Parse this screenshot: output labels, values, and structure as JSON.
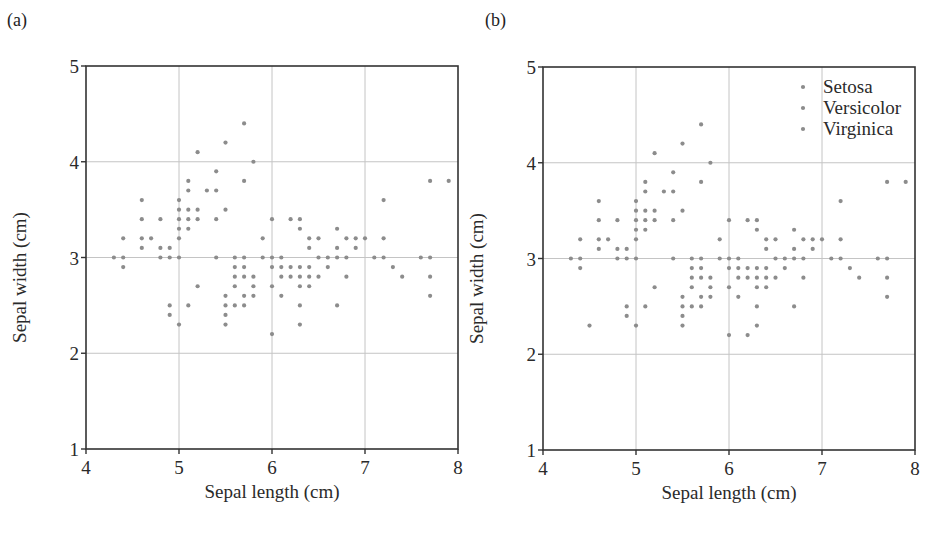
{
  "figure": {
    "panels": [
      {
        "label": "(a)",
        "xlabel": "Sepal length (cm)",
        "ylabel": "Sepal width (cm)"
      },
      {
        "label": "(b)",
        "xlabel": "Sepal length (cm)",
        "ylabel": "Sepal width (cm)"
      }
    ],
    "colors": {
      "dot": "#8c8c8c",
      "grid": "#c4c4c4",
      "axis": "#333333",
      "text": "#2a2a2a"
    }
  },
  "chart_data": [
    {
      "type": "scatter",
      "title": "(a)",
      "xlabel": "Sepal length (cm)",
      "ylabel": "Sepal width (cm)",
      "xlim": [
        4,
        8
      ],
      "ylim": [
        1,
        5
      ],
      "xticks": [
        4,
        5,
        6,
        7,
        8
      ],
      "yticks": [
        1,
        2,
        3,
        4,
        5
      ],
      "grid": true,
      "legend": null,
      "series": [
        {
          "name": "Iris (all)",
          "points": [
            [
              4.3,
              3.0
            ],
            [
              4.4,
              3.0
            ],
            [
              4.4,
              3.2
            ],
            [
              4.4,
              2.9
            ],
            [
              4.6,
              3.1
            ],
            [
              4.6,
              3.4
            ],
            [
              4.6,
              3.6
            ],
            [
              4.6,
              3.2
            ],
            [
              4.7,
              3.2
            ],
            [
              4.8,
              3.4
            ],
            [
              4.8,
              3.0
            ],
            [
              4.8,
              3.1
            ],
            [
              4.9,
              3.0
            ],
            [
              4.9,
              3.1
            ],
            [
              4.9,
              2.5
            ],
            [
              4.9,
              2.4
            ],
            [
              5.0,
              3.6
            ],
            [
              5.0,
              3.4
            ],
            [
              5.0,
              3.0
            ],
            [
              5.0,
              3.3
            ],
            [
              5.0,
              3.5
            ],
            [
              5.0,
              3.2
            ],
            [
              5.0,
              2.3
            ],
            [
              5.1,
              3.5
            ],
            [
              5.1,
              3.7
            ],
            [
              5.1,
              3.3
            ],
            [
              5.1,
              3.4
            ],
            [
              5.1,
              3.8
            ],
            [
              5.1,
              2.5
            ],
            [
              5.2,
              3.5
            ],
            [
              5.2,
              3.4
            ],
            [
              5.2,
              4.1
            ],
            [
              5.2,
              2.7
            ],
            [
              5.3,
              3.7
            ],
            [
              5.4,
              3.9
            ],
            [
              5.4,
              3.7
            ],
            [
              5.4,
              3.4
            ],
            [
              5.4,
              3.0
            ],
            [
              5.5,
              4.2
            ],
            [
              5.5,
              3.5
            ],
            [
              5.5,
              2.3
            ],
            [
              5.5,
              2.4
            ],
            [
              5.5,
              2.5
            ],
            [
              5.5,
              2.6
            ],
            [
              5.6,
              2.9
            ],
            [
              5.6,
              3.0
            ],
            [
              5.6,
              2.5
            ],
            [
              5.6,
              2.7
            ],
            [
              5.6,
              2.8
            ],
            [
              5.7,
              4.4
            ],
            [
              5.7,
              3.8
            ],
            [
              5.7,
              2.8
            ],
            [
              5.7,
              2.6
            ],
            [
              5.7,
              3.0
            ],
            [
              5.7,
              2.9
            ],
            [
              5.7,
              2.5
            ],
            [
              5.8,
              4.0
            ],
            [
              5.8,
              2.7
            ],
            [
              5.8,
              2.6
            ],
            [
              5.8,
              2.8
            ],
            [
              5.9,
              3.0
            ],
            [
              5.9,
              3.2
            ],
            [
              6.0,
              2.2
            ],
            [
              6.0,
              2.9
            ],
            [
              6.0,
              2.7
            ],
            [
              6.0,
              3.4
            ],
            [
              6.0,
              3.0
            ],
            [
              6.1,
              2.9
            ],
            [
              6.1,
              2.8
            ],
            [
              6.1,
              3.0
            ],
            [
              6.1,
              2.6
            ],
            [
              6.2,
              2.9
            ],
            [
              6.2,
              2.8
            ],
            [
              6.2,
              3.4
            ],
            [
              6.3,
              3.3
            ],
            [
              6.3,
              2.5
            ],
            [
              6.3,
              2.3
            ],
            [
              6.3,
              2.9
            ],
            [
              6.3,
              2.7
            ],
            [
              6.3,
              2.8
            ],
            [
              6.3,
              3.4
            ],
            [
              6.4,
              3.2
            ],
            [
              6.4,
              2.9
            ],
            [
              6.4,
              2.7
            ],
            [
              6.4,
              2.8
            ],
            [
              6.4,
              3.1
            ],
            [
              6.5,
              2.8
            ],
            [
              6.5,
              3.0
            ],
            [
              6.5,
              3.2
            ],
            [
              6.6,
              2.9
            ],
            [
              6.6,
              3.0
            ],
            [
              6.7,
              3.1
            ],
            [
              6.7,
              3.0
            ],
            [
              6.7,
              2.5
            ],
            [
              6.7,
              3.3
            ],
            [
              6.8,
              2.8
            ],
            [
              6.8,
              3.0
            ],
            [
              6.8,
              3.2
            ],
            [
              6.9,
              3.1
            ],
            [
              6.9,
              3.2
            ],
            [
              7.0,
              3.2
            ],
            [
              7.1,
              3.0
            ],
            [
              7.2,
              3.6
            ],
            [
              7.2,
              3.2
            ],
            [
              7.2,
              3.0
            ],
            [
              7.3,
              2.9
            ],
            [
              7.4,
              2.8
            ],
            [
              7.6,
              3.0
            ],
            [
              7.7,
              3.8
            ],
            [
              7.7,
              2.6
            ],
            [
              7.7,
              2.8
            ],
            [
              7.7,
              3.0
            ],
            [
              7.9,
              3.8
            ]
          ]
        }
      ]
    },
    {
      "type": "scatter",
      "title": "(b)",
      "xlabel": "Sepal length (cm)",
      "ylabel": "Sepal width (cm)",
      "xlim": [
        4,
        8
      ],
      "ylim": [
        1,
        5
      ],
      "xticks": [
        4,
        5,
        6,
        7,
        8
      ],
      "yticks": [
        1,
        2,
        3,
        4,
        5
      ],
      "grid": true,
      "legend": {
        "position": "upper right",
        "entries": [
          "Setosa",
          "Versicolor",
          "Virginica"
        ]
      },
      "series": [
        {
          "name": "Setosa",
          "points": [
            [
              4.3,
              3.0
            ],
            [
              4.4,
              3.0
            ],
            [
              4.4,
              3.2
            ],
            [
              4.4,
              2.9
            ],
            [
              4.5,
              2.3
            ],
            [
              4.6,
              3.1
            ],
            [
              4.6,
              3.4
            ],
            [
              4.6,
              3.6
            ],
            [
              4.6,
              3.2
            ],
            [
              4.7,
              3.2
            ],
            [
              4.8,
              3.4
            ],
            [
              4.8,
              3.0
            ],
            [
              4.8,
              3.1
            ],
            [
              4.9,
              3.0
            ],
            [
              4.9,
              3.1
            ],
            [
              5.0,
              3.6
            ],
            [
              5.0,
              3.4
            ],
            [
              5.0,
              3.0
            ],
            [
              5.0,
              3.3
            ],
            [
              5.0,
              3.5
            ],
            [
              5.0,
              3.2
            ],
            [
              5.1,
              3.5
            ],
            [
              5.1,
              3.7
            ],
            [
              5.1,
              3.3
            ],
            [
              5.1,
              3.4
            ],
            [
              5.1,
              3.8
            ],
            [
              5.2,
              3.5
            ],
            [
              5.2,
              3.4
            ],
            [
              5.2,
              4.1
            ],
            [
              5.3,
              3.7
            ],
            [
              5.4,
              3.9
            ],
            [
              5.4,
              3.7
            ],
            [
              5.4,
              3.4
            ],
            [
              5.5,
              4.2
            ],
            [
              5.5,
              3.5
            ],
            [
              5.7,
              4.4
            ],
            [
              5.7,
              3.8
            ],
            [
              5.8,
              4.0
            ]
          ]
        },
        {
          "name": "Versicolor",
          "points": [
            [
              4.9,
              2.4
            ],
            [
              5.0,
              2.3
            ],
            [
              5.1,
              2.5
            ],
            [
              5.2,
              2.7
            ],
            [
              5.4,
              3.0
            ],
            [
              5.5,
              2.3
            ],
            [
              5.5,
              2.4
            ],
            [
              5.5,
              2.5
            ],
            [
              5.5,
              2.6
            ],
            [
              5.6,
              2.9
            ],
            [
              5.6,
              3.0
            ],
            [
              5.6,
              2.5
            ],
            [
              5.6,
              2.7
            ],
            [
              5.7,
              2.8
            ],
            [
              5.7,
              2.6
            ],
            [
              5.7,
              3.0
            ],
            [
              5.7,
              2.9
            ],
            [
              5.8,
              2.7
            ],
            [
              5.8,
              2.6
            ],
            [
              5.9,
              3.0
            ],
            [
              5.9,
              3.2
            ],
            [
              6.0,
              2.2
            ],
            [
              6.0,
              2.9
            ],
            [
              6.0,
              2.7
            ],
            [
              6.0,
              3.4
            ],
            [
              6.1,
              2.9
            ],
            [
              6.1,
              2.8
            ],
            [
              6.1,
              3.0
            ],
            [
              6.2,
              2.2
            ],
            [
              6.2,
              2.9
            ],
            [
              6.3,
              3.3
            ],
            [
              6.3,
              2.5
            ],
            [
              6.3,
              2.3
            ],
            [
              6.4,
              3.2
            ],
            [
              6.4,
              2.9
            ],
            [
              6.5,
              2.8
            ],
            [
              6.6,
              2.9
            ],
            [
              6.6,
              3.0
            ],
            [
              6.7,
              3.1
            ],
            [
              6.7,
              3.0
            ],
            [
              6.8,
              2.8
            ],
            [
              6.9,
              3.1
            ],
            [
              7.0,
              3.2
            ]
          ]
        },
        {
          "name": "Virginica",
          "points": [
            [
              4.9,
              2.5
            ],
            [
              5.6,
              2.8
            ],
            [
              5.7,
              2.5
            ],
            [
              5.8,
              2.8
            ],
            [
              6.0,
              3.0
            ],
            [
              6.1,
              2.6
            ],
            [
              6.2,
              2.8
            ],
            [
              6.2,
              3.4
            ],
            [
              6.3,
              2.9
            ],
            [
              6.3,
              2.7
            ],
            [
              6.3,
              2.8
            ],
            [
              6.3,
              3.4
            ],
            [
              6.4,
              2.7
            ],
            [
              6.4,
              2.8
            ],
            [
              6.4,
              3.1
            ],
            [
              6.5,
              3.0
            ],
            [
              6.5,
              3.2
            ],
            [
              6.7,
              2.5
            ],
            [
              6.7,
              3.3
            ],
            [
              6.8,
              3.0
            ],
            [
              6.8,
              3.2
            ],
            [
              6.9,
              3.2
            ],
            [
              7.1,
              3.0
            ],
            [
              7.2,
              3.6
            ],
            [
              7.2,
              3.2
            ],
            [
              7.2,
              3.0
            ],
            [
              7.3,
              2.9
            ],
            [
              7.4,
              2.8
            ],
            [
              7.6,
              3.0
            ],
            [
              7.7,
              3.8
            ],
            [
              7.7,
              2.6
            ],
            [
              7.7,
              2.8
            ],
            [
              7.7,
              3.0
            ],
            [
              7.9,
              3.8
            ]
          ]
        }
      ]
    }
  ]
}
